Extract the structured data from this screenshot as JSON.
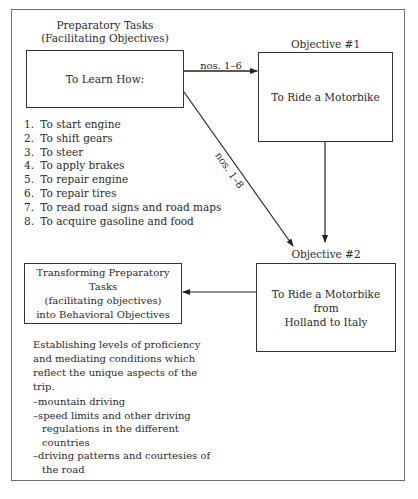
{
  "diagram": {
    "preparatory": {
      "heading_line1": "Preparatory Tasks",
      "heading_line2": "(Facilitating Objectives)",
      "box_label": "To Learn How:",
      "tasks": [
        {
          "num": "1.",
          "text": "To start engine"
        },
        {
          "num": "2.",
          "text": "To shift gears"
        },
        {
          "num": "3.",
          "text": "To steer"
        },
        {
          "num": "4.",
          "text": "To apply brakes"
        },
        {
          "num": "5.",
          "text": "To repair engine"
        },
        {
          "num": "6.",
          "text": "To repair tires"
        },
        {
          "num": "7.",
          "text": "To read road signs and road maps"
        },
        {
          "num": "8.",
          "text": "To acquire gasoline and food"
        }
      ]
    },
    "objective1": {
      "heading": "Objective #1",
      "box_label": "To Ride a Motorbike"
    },
    "objective2": {
      "heading": "Objective #2",
      "box_line1": "To Ride a Motorbike",
      "box_line2": "from",
      "box_line3": "Holland to Italy"
    },
    "transforming": {
      "box_line1": "Transforming Preparatory Tasks",
      "box_line2": "(facilitating objectives)",
      "box_line3": "into Behavioral Objectives",
      "description": "Establishing levels of proficiency and mediating conditions which reflect the unique aspects of the trip.",
      "conditions": [
        "–mountain driving",
        "–speed limits and other driving regulations in the different countries",
        "–driving patterns and courtesies of the road"
      ]
    },
    "arrows": {
      "prep_to_obj1_label": "nos. 1–6",
      "prep_to_obj2_label": "nos. 1–8"
    }
  }
}
